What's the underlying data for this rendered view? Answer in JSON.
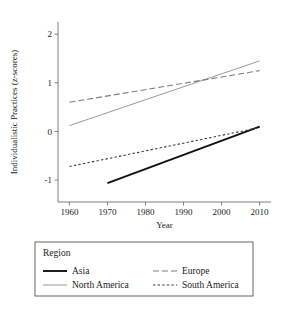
{
  "chart_data": {
    "type": "line",
    "title": "",
    "xlabel": "Year",
    "ylabel": "Individualistic Practices (z-scores)",
    "xlim": [
      1957,
      2013
    ],
    "ylim": [
      -1.45,
      2.25
    ],
    "xticks": [
      1960,
      1970,
      1980,
      1990,
      2000,
      2010
    ],
    "xtick_labels": [
      "1960",
      "1970",
      "1980",
      "1990",
      "2000",
      "2010"
    ],
    "yticks": [
      -1,
      0,
      1,
      2
    ],
    "ytick_labels": [
      "-1",
      "0",
      "1",
      "2"
    ],
    "grid": false,
    "legend_position": "below",
    "legend_title": "Region",
    "series": [
      {
        "name": "Asia",
        "style": "solid",
        "color": "#111111",
        "width": 1.9,
        "x": [
          1970,
          2010
        ],
        "values": [
          -1.06,
          0.1
        ]
      },
      {
        "name": "North America",
        "style": "solid",
        "color": "#9a9a9a",
        "width": 1.0,
        "x": [
          1960,
          2010
        ],
        "values": [
          0.12,
          1.45
        ]
      },
      {
        "name": "Europe",
        "style": "longdash",
        "color": "#7c7c7c",
        "width": 1.1,
        "x": [
          1960,
          2010
        ],
        "values": [
          0.6,
          1.25
        ]
      },
      {
        "name": "South America",
        "style": "shortdash",
        "color": "#3a3a3a",
        "width": 1.1,
        "x": [
          1960,
          2010
        ],
        "values": [
          -0.72,
          0.08
        ]
      }
    ]
  },
  "legend": {
    "title": "Region",
    "entries": [
      {
        "label": "Asia",
        "column": 0,
        "row": 0
      },
      {
        "label": "Europe",
        "column": 1,
        "row": 0
      },
      {
        "label": "North America",
        "column": 0,
        "row": 1
      },
      {
        "label": "South America",
        "column": 1,
        "row": 1
      }
    ]
  },
  "axes": {
    "x_title": "Year",
    "y_title": "Individualistic Practices (z-scores)"
  },
  "colors": {
    "axis": "#6f6f6f",
    "text": "#1a1a1a",
    "asia": "#111111",
    "north_america": "#9a9a9a",
    "europe": "#7c7c7c",
    "south_america": "#3a3a3a",
    "legend_border": "#555555",
    "background": "#ffffff"
  }
}
